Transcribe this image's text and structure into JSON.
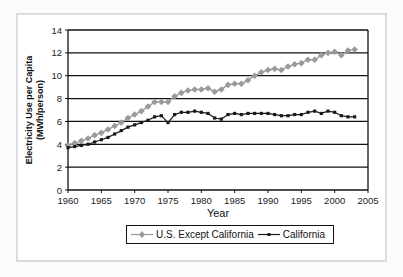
{
  "chart_data": {
    "type": "line",
    "title": "",
    "xlabel": "Year",
    "ylabel": "Electricity Use per Capita (MWh/person)",
    "ylabel_lines": [
      "Electricity Use per Capita",
      "(MWh/person)"
    ],
    "xlim": [
      1960,
      2005
    ],
    "ylim": [
      0,
      14
    ],
    "x_ticks": [
      1960,
      1965,
      1970,
      1975,
      1980,
      1985,
      1990,
      1995,
      2000,
      2005
    ],
    "y_ticks": [
      0,
      2,
      4,
      6,
      8,
      10,
      12,
      14
    ],
    "grid": "horizontal",
    "legend_position": "bottom",
    "x": [
      1960,
      1961,
      1962,
      1963,
      1964,
      1965,
      1966,
      1967,
      1968,
      1969,
      1970,
      1971,
      1972,
      1973,
      1974,
      1975,
      1976,
      1977,
      1978,
      1979,
      1980,
      1981,
      1982,
      1983,
      1984,
      1985,
      1986,
      1987,
      1988,
      1989,
      1990,
      1991,
      1992,
      1993,
      1994,
      1995,
      1996,
      1997,
      1998,
      1999,
      2000,
      2001,
      2002,
      2003
    ],
    "series": [
      {
        "name": "U.S. Except California",
        "color": "#9a9a9a",
        "marker": "diamond",
        "values": [
          3.9,
          4.1,
          4.3,
          4.5,
          4.8,
          5.0,
          5.3,
          5.6,
          5.9,
          6.3,
          6.6,
          6.9,
          7.3,
          7.7,
          7.7,
          7.7,
          8.2,
          8.5,
          8.7,
          8.8,
          8.8,
          8.9,
          8.6,
          8.8,
          9.2,
          9.3,
          9.3,
          9.6,
          10.0,
          10.3,
          10.5,
          10.6,
          10.5,
          10.8,
          11.0,
          11.1,
          11.4,
          11.4,
          11.8,
          12.0,
          12.1,
          11.8,
          12.2,
          12.3
        ]
      },
      {
        "name": "California",
        "color": "#1a1a1a",
        "marker": "square",
        "values": [
          3.7,
          3.8,
          3.9,
          4.0,
          4.2,
          4.4,
          4.6,
          4.9,
          5.2,
          5.5,
          5.7,
          5.9,
          6.1,
          6.4,
          6.5,
          5.9,
          6.6,
          6.8,
          6.8,
          6.9,
          6.8,
          6.7,
          6.3,
          6.2,
          6.6,
          6.7,
          6.6,
          6.7,
          6.7,
          6.7,
          6.7,
          6.6,
          6.5,
          6.5,
          6.6,
          6.6,
          6.8,
          6.9,
          6.7,
          6.9,
          6.8,
          6.5,
          6.4,
          6.4
        ]
      }
    ]
  },
  "legend": {
    "items": [
      {
        "label": "U.S. Except California"
      },
      {
        "label": "California"
      }
    ]
  }
}
